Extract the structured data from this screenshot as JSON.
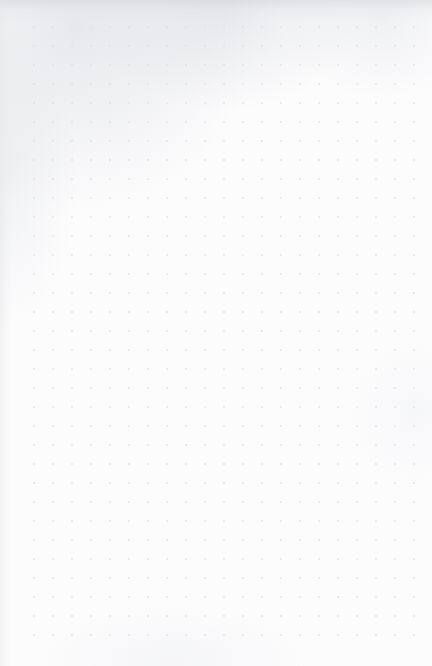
{
  "page": {
    "type": "dot-grid-notebook-page",
    "width": 432,
    "height": 666,
    "content_text": "",
    "has_handwriting": false,
    "has_printed_text": false
  },
  "paper": {
    "background_color": "#fcfcfd",
    "edge_shadow_color": "#d6d8dd",
    "top_smudge_color": "#cdd0d6"
  },
  "grid": {
    "label": "dot-grid",
    "dot_color": "#dddfe4",
    "dot_diameter_px": 2,
    "spacing_px": 19,
    "columns": 21,
    "rows": 33,
    "origin_x_px": 34,
    "origin_y_px": 27,
    "margin_left_px": 34,
    "margin_right_px": 17,
    "margin_top_px": 27,
    "margin_bottom_px": 21
  }
}
